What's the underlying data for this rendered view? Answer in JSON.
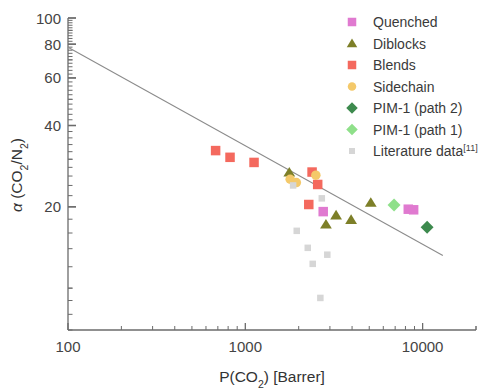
{
  "chart_data": {
    "type": "scatter",
    "title": "",
    "xlabel": "P(CO2) [Barrer]",
    "ylabel": "α (CO2/N2)",
    "xscale": "log",
    "yscale": "log",
    "xlim": [
      100,
      20000
    ],
    "ylim": [
      7,
      100
    ],
    "grid": false,
    "legend_position": "top-right",
    "xticks": [
      100,
      1000,
      10000
    ],
    "xtick_labels": [
      "100",
      "1000",
      "10000"
    ],
    "yticks": [
      20,
      40,
      60,
      80,
      100
    ],
    "ytick_labels": [
      "20",
      "40",
      "60",
      "80",
      "100"
    ],
    "annotations": [
      {
        "name": "upper-bound-line",
        "type": "line",
        "color": "#8c8c8c",
        "points": [
          [
            100,
            78
          ],
          [
            13000,
            13.2
          ]
        ]
      }
    ],
    "series": [
      {
        "name": "Quenched",
        "marker": "square",
        "color": "#e07ad0",
        "points": [
          [
            2750,
            19.2
          ],
          [
            8300,
            19.6
          ],
          [
            8900,
            19.5
          ]
        ]
      },
      {
        "name": "Diblocks",
        "marker": "triangle",
        "color": "#7d7f28",
        "points": [
          [
            1770,
            26.8
          ],
          [
            2850,
            17.2
          ],
          [
            3250,
            18.6
          ],
          [
            3950,
            17.9
          ],
          [
            5100,
            20.7
          ]
        ]
      },
      {
        "name": "Blends",
        "marker": "square",
        "color": "#f4695e",
        "points": [
          [
            680,
            32.3
          ],
          [
            820,
            30.5
          ],
          [
            1120,
            29.2
          ],
          [
            2380,
            26.9
          ],
          [
            2560,
            24.2
          ],
          [
            2280,
            20.4
          ]
        ]
      },
      {
        "name": "Sidechain",
        "marker": "circle",
        "color": "#f4c96a",
        "points": [
          [
            1790,
            25.3
          ],
          [
            1940,
            24.6
          ],
          [
            2500,
            26.2
          ]
        ]
      },
      {
        "name": "PIM-1 (path 2)",
        "marker": "diamond",
        "color": "#3d8a4e",
        "points": [
          [
            10600,
            16.8
          ]
        ]
      },
      {
        "name": "PIM-1 (path 1)",
        "marker": "diamond",
        "color": "#8fe08a",
        "points": [
          [
            6900,
            20.3
          ]
        ]
      },
      {
        "name": "Literature data",
        "marker": "square",
        "color": "#d6d6d6",
        "superscript": "[11]",
        "points": [
          [
            1860,
            24.0
          ],
          [
            1950,
            16.3
          ],
          [
            2250,
            14.1
          ],
          [
            2400,
            12.3
          ],
          [
            2900,
            13.3
          ],
          [
            2650,
            9.2
          ],
          [
            2700,
            21.5
          ]
        ]
      }
    ]
  },
  "axes": {
    "x_title_main": "P(CO",
    "x_title_sub": "2",
    "x_title_rest": ") [Barrer]",
    "y_title_alpha": "α",
    "y_title_open": " (CO",
    "y_title_sub1": "2",
    "y_title_slash": "/N",
    "y_title_sub2": "2",
    "y_title_close": ")"
  },
  "legend": {
    "items": [
      {
        "label": "Quenched",
        "marker": "square",
        "color": "#e07ad0"
      },
      {
        "label": "Diblocks",
        "marker": "triangle",
        "color": "#7d7f28"
      },
      {
        "label": "Blends",
        "marker": "square",
        "color": "#f4695e"
      },
      {
        "label": "Sidechain",
        "marker": "circle",
        "color": "#f4c96a"
      },
      {
        "label": "PIM-1 (path 2)",
        "marker": "diamond",
        "color": "#3d8a4e"
      },
      {
        "label": "PIM-1 (path 1)",
        "marker": "diamond",
        "color": "#8fe08a"
      },
      {
        "label": "Literature data",
        "marker": "square",
        "color": "#d6d6d6",
        "superscript": "[11]"
      }
    ]
  },
  "colors": {
    "axis": "#6b6b6b",
    "text": "#3a3a3a",
    "trendline": "#8c8c8c",
    "background": "#ffffff"
  }
}
